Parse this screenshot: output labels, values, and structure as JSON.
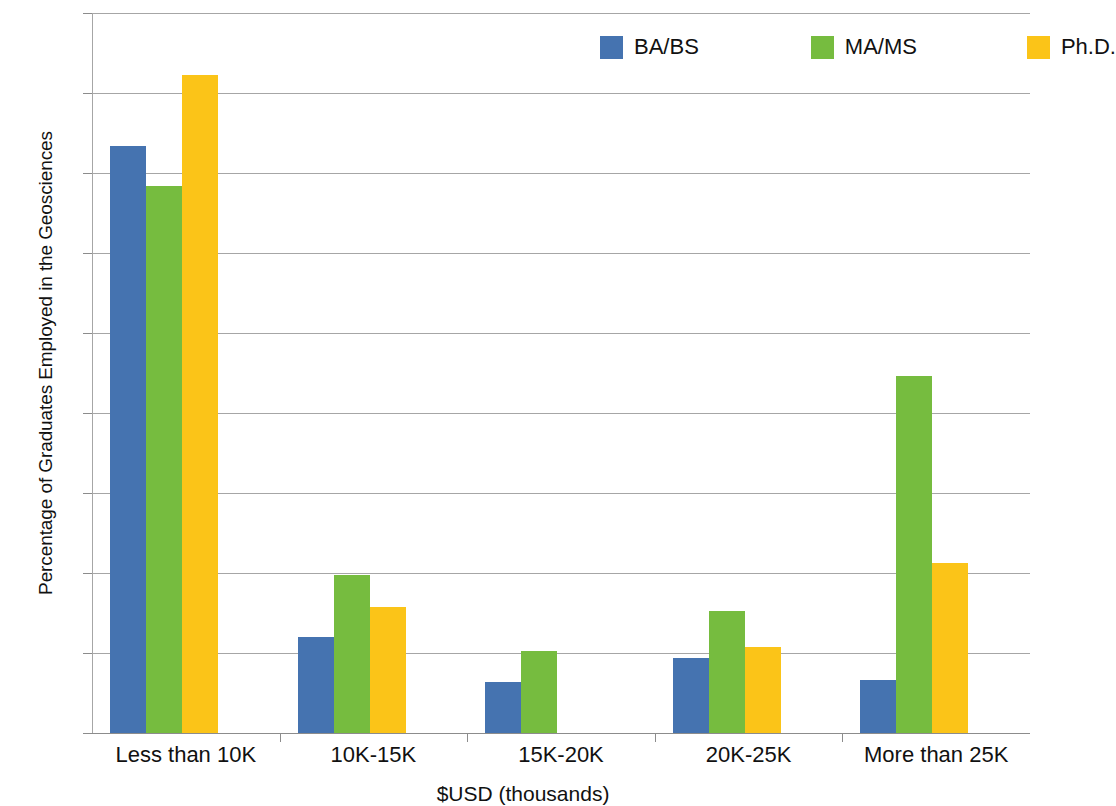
{
  "chart_data": {
    "type": "bar",
    "title": "",
    "xlabel": "$USD (thousands)",
    "ylabel": "Percentage of Graduates Employed in the Geosciences",
    "categories": [
      "Less than 10K",
      "10K-15K",
      "15K-20K",
      "20K-25K",
      "More than 25K"
    ],
    "series": [
      {
        "name": "BA/BS",
        "color": "#4573b0",
        "values": [
          36.7,
          6.0,
          3.2,
          4.7,
          3.3
        ]
      },
      {
        "name": "MA/MS",
        "color": "#76bc3f",
        "values": [
          34.2,
          9.9,
          5.1,
          7.6,
          22.3
        ]
      },
      {
        "name": "Ph.D.",
        "color": "#fbc418",
        "values": [
          41.1,
          7.9,
          null,
          5.4,
          10.6
        ]
      }
    ],
    "ylim": [
      0,
      45
    ],
    "ytick_values": [
      0,
      5,
      10,
      15,
      20,
      25,
      30,
      35,
      40,
      45
    ],
    "ytick_labels": [
      "0%",
      "5%",
      "10%",
      "15%",
      "20%",
      "25%",
      "30%",
      "35%",
      "40%",
      "45%"
    ],
    "grid": true,
    "legend_position": "top-right"
  },
  "legend": {
    "items": [
      {
        "label": "BA/BS",
        "color": "#4573b0"
      },
      {
        "label": "MA/MS",
        "color": "#76bc3f"
      },
      {
        "label": "Ph.D.",
        "color": "#fbc418"
      }
    ]
  }
}
